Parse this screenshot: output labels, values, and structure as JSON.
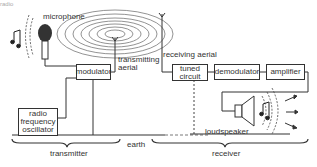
{
  "figure": {
    "corner_text": "radio",
    "labels": {
      "microphone": "microphone",
      "transmitting_aerial": "transmitting\naerial",
      "receiving_aerial": "receiving aerial",
      "earth": "earth",
      "loudspeaker": "loudspeaker",
      "transmitter": "transmitter",
      "receiver": "receiver"
    },
    "blocks": {
      "modulator": "modulator",
      "rf_oscillator": "radio\nfrequency\noscillator",
      "tuned_circuit": "tuned\ncircuit",
      "demodulator": "demodulator",
      "amplifier": "amplifier"
    },
    "colors": {
      "line": "#333333",
      "background": "#ffffff"
    }
  }
}
